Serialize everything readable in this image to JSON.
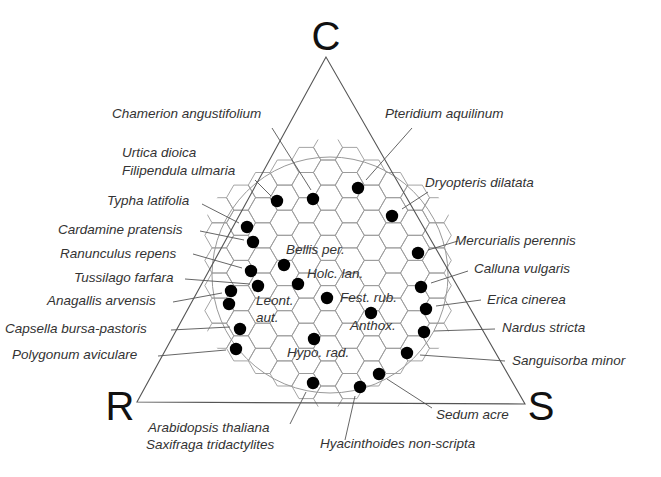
{
  "diagram": {
    "type": "CSR triangle (Grime's plant strategy)",
    "vertices": [
      {
        "label": "C",
        "x": 326,
        "y": 57,
        "tx": 326,
        "ty": 50
      },
      {
        "label": "R",
        "x": 137,
        "y": 402,
        "tx": 120,
        "ty": 420
      },
      {
        "label": "S",
        "x": 525,
        "y": 404,
        "tx": 541,
        "ty": 420
      }
    ],
    "hex_grid": {
      "cx": 328,
      "cy": 273,
      "radius": 122,
      "hex_r": 14.5,
      "clip_extra": 12
    },
    "circle": {
      "cx": 330,
      "cy": 275,
      "r": 118
    },
    "species": [
      {
        "label": "Chamerion angustifolium",
        "lx": 112,
        "ly": 118,
        "dot": [
          313,
          199
        ],
        "line": [
          [
            272,
            128
          ],
          [
            311,
            190
          ]
        ]
      },
      {
        "label": "Pteridium aquilinum",
        "lx": 385,
        "ly": 118,
        "dot": [
          358,
          188
        ],
        "line": [
          [
            412,
            128
          ],
          [
            366,
            180
          ]
        ]
      },
      {
        "label": "Urtica dioica",
        "lx": 122,
        "ly": 157,
        "dot": null,
        "line": null
      },
      {
        "label": "Filipendula ulmaria",
        "lx": 122,
        "ly": 175,
        "dot": [
          277,
          201
        ],
        "line": [
          [
            255,
            180
          ],
          [
            271,
            196
          ]
        ]
      },
      {
        "label": "Dryopteris dilatata",
        "lx": 425,
        "ly": 187,
        "dot": [
          392,
          216
        ],
        "line": [
          [
            428,
            192
          ],
          [
            402,
            209
          ]
        ]
      },
      {
        "label": "Typha latifolia",
        "lx": 107,
        "ly": 205,
        "dot": [
          247,
          227
        ],
        "line": [
          [
            202,
            204
          ],
          [
            239,
            223
          ]
        ]
      },
      {
        "label": "Cardamine pratensis",
        "lx": 58,
        "ly": 234,
        "dot": [
          253,
          242
        ],
        "line": [
          [
            200,
            231
          ],
          [
            244,
            240
          ]
        ]
      },
      {
        "label": "Mercurialis perennis",
        "lx": 455,
        "ly": 245,
        "dot": [
          418,
          253
        ],
        "line": [
          [
            458,
            241
          ],
          [
            428,
            250
          ]
        ]
      },
      {
        "label": "Ranunculus repens",
        "lx": 60,
        "ly": 258,
        "dot": [
          251,
          271
        ],
        "line": [
          [
            193,
            254
          ],
          [
            242,
            268
          ]
        ]
      },
      {
        "label": "Bellis per.",
        "lx": 286,
        "ly": 254,
        "dot": [
          284,
          265
        ],
        "line": null,
        "inner": true
      },
      {
        "label": "Tussilago farfara",
        "lx": 74,
        "ly": 282,
        "dot": [
          258,
          286
        ],
        "line": [
          [
            185,
            279
          ],
          [
            250,
            284
          ]
        ]
      },
      {
        "label": "Calluna vulgaris",
        "lx": 474,
        "ly": 273,
        "dot": [
          421,
          287
        ],
        "line": [
          [
            468,
            271
          ],
          [
            431,
            283
          ]
        ]
      },
      {
        "label": "Holc. lan.",
        "lx": 307,
        "ly": 278,
        "dot": [
          298,
          284
        ],
        "line": null,
        "inner": true
      },
      {
        "label": "Anagallis arvensis",
        "lx": 47,
        "ly": 305,
        "dot": [
          231,
          291
        ],
        "line": [
          [
            173,
            302
          ],
          [
            222,
            293
          ]
        ]
      },
      {
        "label": "Leont.",
        "lx": 256,
        "ly": 305,
        "dot": [
          229,
          304
        ],
        "line": null,
        "inner": true
      },
      {
        "label": "aut.",
        "lx": 256,
        "ly": 322,
        "dot": null,
        "line": null,
        "inner": true
      },
      {
        "label": "Fest. rub.",
        "lx": 340,
        "ly": 302,
        "dot": [
          327,
          298
        ],
        "line": null,
        "inner": true
      },
      {
        "label": "Erica cinerea",
        "lx": 487,
        "ly": 304,
        "dot": [
          426,
          309
        ],
        "line": [
          [
            481,
            300
          ],
          [
            436,
            306
          ]
        ]
      },
      {
        "label": "Anthox.",
        "lx": 350,
        "ly": 330,
        "dot": [
          371,
          313
        ],
        "line": null,
        "inner": true
      },
      {
        "label": "Capsella bursa-pastoris",
        "lx": 5,
        "ly": 333,
        "dot": [
          240,
          329
        ],
        "line": [
          [
            171,
            330
          ],
          [
            230,
            327
          ]
        ]
      },
      {
        "label": "Nardus stricta",
        "lx": 502,
        "ly": 332,
        "dot": [
          424,
          332
        ],
        "line": [
          [
            495,
            329
          ],
          [
            434,
            331
          ]
        ]
      },
      {
        "label": "Hypo. rad.",
        "lx": 287,
        "ly": 357,
        "dot": [
          314,
          339
        ],
        "line": null,
        "inner": true
      },
      {
        "label": "Polygonum aviculare",
        "lx": 12,
        "ly": 359,
        "dot": [
          236,
          349
        ],
        "line": [
          [
            158,
            356
          ],
          [
            226,
            350
          ]
        ]
      },
      {
        "label": "Sanguisorba minor",
        "lx": 512,
        "ly": 365,
        "dot": [
          407,
          353
        ],
        "line": [
          [
            505,
            361
          ],
          [
            420,
            355
          ]
        ]
      },
      {
        "label": "Sedum acre",
        "lx": 436,
        "ly": 419,
        "dot": [
          379,
          374
        ],
        "line": [
          [
            432,
            408
          ],
          [
            387,
            379
          ]
        ]
      },
      {
        "label": "Arabidopsis thaliana",
        "lx": 148,
        "ly": 432,
        "dot": [
          313,
          383
        ],
        "line": [
          [
            290,
            424
          ],
          [
            306,
            392
          ]
        ]
      },
      {
        "label": "Saxifraga tridactylites",
        "lx": 146,
        "ly": 449,
        "dot": null,
        "line": null
      },
      {
        "label": "Hyacinthoides non-scripta",
        "lx": 320,
        "ly": 448,
        "dot": [
          360,
          387
        ],
        "line": [
          [
            345,
            440
          ],
          [
            355,
            396
          ]
        ]
      }
    ]
  }
}
